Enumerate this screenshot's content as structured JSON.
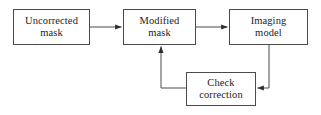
{
  "diagram": {
    "background_color": "#ffffff",
    "stroke_color": "#4a4a4a",
    "text_color": "#1c1c1c",
    "nodes": [
      {
        "id": "uncorrected-mask",
        "label": "Uncorrected\nmask",
        "line1": "Uncorrected",
        "line2": "mask"
      },
      {
        "id": "modified-mask",
        "label": "Modified\nmask",
        "line1": "Modified",
        "line2": "mask"
      },
      {
        "id": "imaging-model",
        "label": "Imaging\nmodel",
        "line1": "Imaging",
        "line2": "model"
      },
      {
        "id": "check-correction",
        "label": "Check\ncorrection",
        "line1": "Check",
        "line2": "correction"
      }
    ],
    "edges": [
      {
        "id": "uncorrected-to-modified",
        "from": "uncorrected-mask",
        "to": "modified-mask",
        "label": "",
        "arrow": "end"
      },
      {
        "id": "modified-to-imaging",
        "from": "modified-mask",
        "to": "imaging-model",
        "label": "",
        "arrow": "end"
      },
      {
        "id": "imaging-to-check",
        "from": "imaging-model",
        "to": "check-correction",
        "label": "",
        "arrow": "end"
      },
      {
        "id": "check-to-modified",
        "from": "check-correction",
        "to": "modified-mask",
        "label": "",
        "arrow": "end"
      }
    ]
  }
}
